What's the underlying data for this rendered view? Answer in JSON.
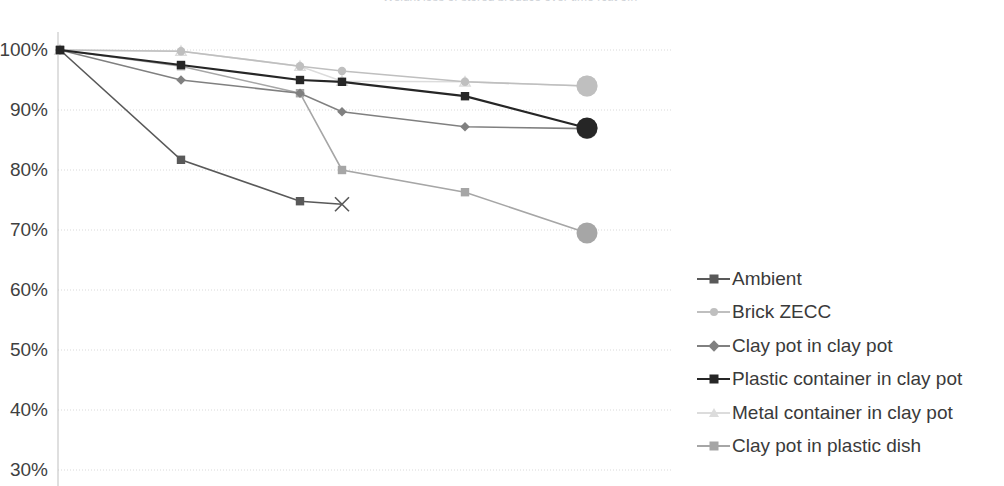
{
  "chart": {
    "title_clipped": "Weight loss of stored produce over time (cut off)",
    "y_axis": {
      "ticks": [
        "100%",
        "90%",
        "80%",
        "70%",
        "60%",
        "50%",
        "40%",
        "30%"
      ],
      "min_label": "30%",
      "max_label": "100%"
    },
    "gridline_color": "#d9d9d9",
    "axis_color": "#bfbfbf",
    "background": "#ffffff"
  },
  "legend": {
    "position": "right",
    "items": [
      {
        "label": "Ambient",
        "color": "#595959",
        "marker": "square"
      },
      {
        "label": "Brick ZECC",
        "color": "#bfbfbf",
        "marker": "circle"
      },
      {
        "label": "Clay pot in clay pot",
        "color": "#808080",
        "marker": "diamond"
      },
      {
        "label": "Plastic container in clay pot",
        "color": "#262626",
        "marker": "square"
      },
      {
        "label": "Metal container in clay pot",
        "color": "#dcdcdc",
        "marker": "triangle"
      },
      {
        "label": "Clay pot in plastic dish",
        "color": "#a6a6a6",
        "marker": "square"
      }
    ]
  },
  "chart_data": {
    "type": "line",
    "title": "",
    "xlabel": "",
    "ylabel": "",
    "ylim": [
      30,
      100
    ],
    "ytick_values": [
      100,
      90,
      80,
      70,
      60,
      50,
      40,
      30
    ],
    "ytick_labels": [
      "100%",
      "90%",
      "80%",
      "70%",
      "60%",
      "50%",
      "40%",
      "30%"
    ],
    "grid": true,
    "legend_position": "right",
    "x": [
      0,
      1,
      2,
      2.35,
      3.35,
      4.35
    ],
    "x_pixels": [
      60,
      181,
      300,
      342,
      465,
      587
    ],
    "series": [
      {
        "name": "Ambient",
        "color": "#595959",
        "marker": "square",
        "end_marker": "x",
        "values": [
          100,
          81.7,
          74.8,
          74.3,
          null,
          null
        ]
      },
      {
        "name": "Brick ZECC",
        "color": "#bfbfbf",
        "marker": "circle",
        "end_marker": "circle-large",
        "values": [
          100,
          99.8,
          97.3,
          96.5,
          94.7,
          94.0
        ]
      },
      {
        "name": "Clay pot in clay pot",
        "color": "#808080",
        "marker": "diamond",
        "end_marker": "circle-large",
        "values": [
          100,
          95.0,
          92.8,
          89.7,
          87.2,
          86.9
        ]
      },
      {
        "name": "Plastic container in clay pot",
        "color": "#262626",
        "marker": "square",
        "end_marker": "circle-large",
        "values": [
          100,
          97.5,
          95.0,
          94.7,
          92.3,
          87.0
        ]
      },
      {
        "name": "Metal container in clay pot",
        "color": "#dcdcdc",
        "marker": "triangle",
        "end_marker": "circle-large",
        "values": [
          100,
          99.8,
          97.3,
          94.8,
          94.7,
          94.0
        ]
      },
      {
        "name": "Clay pot in plastic dish",
        "color": "#a6a6a6",
        "marker": "square",
        "end_marker": "circle-large",
        "values": [
          100,
          97.3,
          92.8,
          80.0,
          76.3,
          69.5
        ]
      }
    ]
  }
}
